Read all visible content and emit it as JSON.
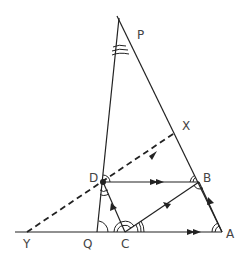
{
  "diagram": {
    "title": "",
    "points": {
      "P": {
        "label": "P",
        "x": 119,
        "y": 20
      },
      "X": {
        "label": "X",
        "x": 176,
        "y": 132
      },
      "D": {
        "label": "D",
        "x": 103,
        "y": 182
      },
      "B": {
        "label": "B",
        "x": 199,
        "y": 182
      },
      "Y": {
        "label": "Y",
        "x": 27,
        "y": 232
      },
      "Q": {
        "label": "Q",
        "x": 97,
        "y": 232
      },
      "C": {
        "label": "C",
        "x": 125,
        "y": 232
      },
      "A": {
        "label": "A",
        "x": 222,
        "y": 232
      }
    },
    "segments": [
      {
        "from": "P",
        "to": "Q",
        "style": "solid"
      },
      {
        "from": "P",
        "to": "A",
        "style": "solid"
      },
      {
        "from": "Y",
        "to": "A",
        "style": "solid"
      },
      {
        "from": "D",
        "to": "B",
        "style": "solid",
        "arrows": 2
      },
      {
        "from": "C",
        "to": "B",
        "style": "solid",
        "arrows": 1
      },
      {
        "from": "C",
        "to": "D",
        "style": "solid",
        "arrows": 1
      },
      {
        "from": "A",
        "to": "B",
        "style": "solid",
        "arrows": 1
      },
      {
        "from": "Y",
        "to": "X",
        "style": "dashed",
        "arrows": 1
      }
    ],
    "colors": {
      "line": "#222222",
      "label": "#444444"
    }
  }
}
